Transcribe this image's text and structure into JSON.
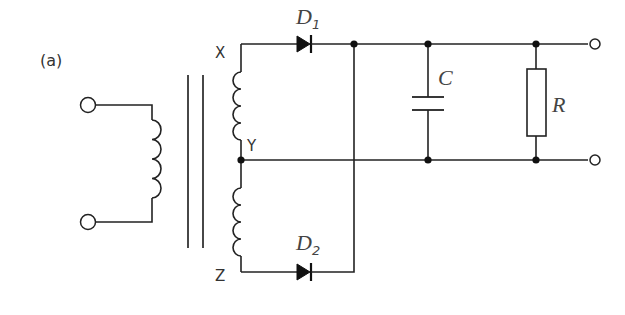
{
  "figure": {
    "panel_label": "(a)"
  },
  "nodes": {
    "x_label": "X",
    "y_label": "Y",
    "z_label": "Z"
  },
  "components": {
    "d1": {
      "symbol": "D",
      "subscript": "1",
      "type": "diode"
    },
    "d2": {
      "symbol": "D",
      "subscript": "2",
      "type": "diode"
    },
    "capacitor": {
      "symbol": "C",
      "type": "capacitor"
    },
    "resistor": {
      "symbol": "R",
      "type": "resistor"
    },
    "transformer": {
      "type": "centre-tapped transformer",
      "core": "iron-core (double line)"
    }
  },
  "terminals": {
    "input": [
      "input-top",
      "input-bottom"
    ],
    "output": [
      "output-positive",
      "output-negative"
    ]
  },
  "colors": {
    "line": "#222222",
    "label": "#333333",
    "background": "#ffffff"
  }
}
